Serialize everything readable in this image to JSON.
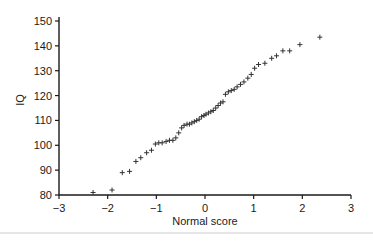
{
  "chart_data": {
    "type": "scatter",
    "title": "",
    "xlabel": "Normal score",
    "ylabel": "IQ",
    "xlim": [
      -3,
      3
    ],
    "ylim": [
      80,
      150
    ],
    "x_ticks": [
      -3,
      -2,
      -1,
      0,
      1,
      2,
      3
    ],
    "x_tick_labels": [
      "−3",
      "−2",
      "−1",
      "0",
      "1",
      "2",
      "3"
    ],
    "y_ticks": [
      80,
      90,
      100,
      110,
      120,
      130,
      140,
      150
    ],
    "y_tick_labels": [
      "80",
      "90",
      "100",
      "110",
      "120",
      "130",
      "140",
      "150"
    ],
    "grid": false,
    "legend": null,
    "marker": "plus",
    "marker_color": "#333333",
    "points": [
      [
        -2.3,
        81
      ],
      [
        -1.91,
        82
      ],
      [
        -1.7,
        89
      ],
      [
        -1.55,
        89.5
      ],
      [
        -1.42,
        93.5
      ],
      [
        -1.32,
        95
      ],
      [
        -1.2,
        97
      ],
      [
        -1.1,
        98
      ],
      [
        -1.02,
        100.5
      ],
      [
        -0.95,
        101
      ],
      [
        -0.88,
        101
      ],
      [
        -0.8,
        101.5
      ],
      [
        -0.73,
        102
      ],
      [
        -0.66,
        102
      ],
      [
        -0.6,
        103
      ],
      [
        -0.54,
        105
      ],
      [
        -0.48,
        107
      ],
      [
        -0.43,
        108
      ],
      [
        -0.37,
        108.5
      ],
      [
        -0.32,
        108.5
      ],
      [
        -0.27,
        109
      ],
      [
        -0.22,
        109.5
      ],
      [
        -0.17,
        110
      ],
      [
        -0.12,
        110.5
      ],
      [
        -0.07,
        111.5
      ],
      [
        -0.02,
        112
      ],
      [
        0.02,
        112.5
      ],
      [
        0.07,
        113
      ],
      [
        0.12,
        113.5
      ],
      [
        0.17,
        114
      ],
      [
        0.22,
        115
      ],
      [
        0.27,
        116
      ],
      [
        0.32,
        117
      ],
      [
        0.37,
        117.5
      ],
      [
        0.42,
        120.5
      ],
      [
        0.48,
        121.5
      ],
      [
        0.54,
        122
      ],
      [
        0.6,
        122.5
      ],
      [
        0.66,
        123.5
      ],
      [
        0.73,
        124.5
      ],
      [
        0.8,
        125.5
      ],
      [
        0.88,
        127
      ],
      [
        0.95,
        128.5
      ],
      [
        1.02,
        131
      ],
      [
        1.1,
        132.5
      ],
      [
        1.23,
        133
      ],
      [
        1.37,
        135
      ],
      [
        1.47,
        136
      ],
      [
        1.6,
        138
      ],
      [
        1.74,
        138
      ],
      [
        1.95,
        140.5
      ],
      [
        2.36,
        143.5
      ]
    ]
  }
}
